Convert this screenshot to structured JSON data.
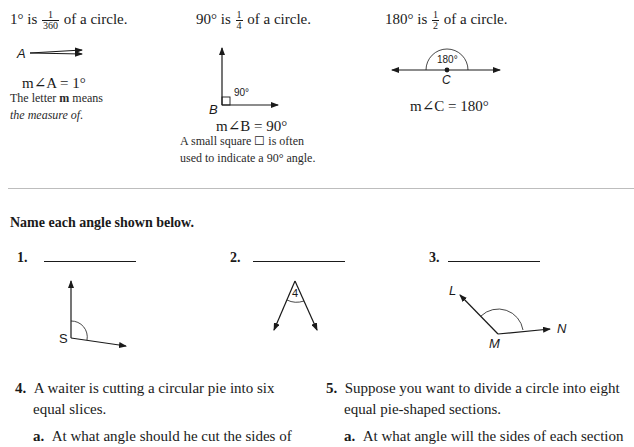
{
  "intro": [
    {
      "heading_prefix": "1° is",
      "fraction": {
        "num": "1",
        "den": "360"
      },
      "heading_suffix": "of a circle.",
      "vertex_label": "A",
      "measure": "m∠A = 1°",
      "note_line1": "The letter m means",
      "note_bold": "m",
      "note_line2": "the measure of."
    },
    {
      "heading_prefix": "90° is",
      "fraction": {
        "num": "1",
        "den": "4"
      },
      "heading_suffix": "of a circle.",
      "vertex_label": "B",
      "angle_label": "90°",
      "measure": "m∠B = 90°",
      "note_line1": "A small square ☐ is often",
      "note_line2": "used to indicate a 90° angle."
    },
    {
      "heading_prefix": "180° is",
      "fraction": {
        "num": "1",
        "den": "2"
      },
      "heading_suffix": "of a circle.",
      "vertex_label": "C",
      "angle_label": "180°",
      "measure": "m∠C = 180°"
    }
  ],
  "instruction": "Name each angle shown below.",
  "questions": [
    {
      "number": "1.",
      "answer": "",
      "vertex_label": "S"
    },
    {
      "number": "2.",
      "answer": "",
      "angle_label": "4"
    },
    {
      "number": "3.",
      "answer": "",
      "labels": {
        "ray1": "L",
        "vertex": "M",
        "ray2": "N"
      }
    }
  ],
  "problems": [
    {
      "number": "4.",
      "line1": "A waiter is cutting a circular pie into six",
      "line2": "equal slices.",
      "sub_label": "a.",
      "sub_text": "At what angle should he cut the sides of"
    },
    {
      "number": "5.",
      "line1": "Suppose you want to divide a circle into eight",
      "line2": "equal pie-shaped sections.",
      "sub_label": "a.",
      "sub_text": "At what angle will the sides of each section"
    }
  ]
}
